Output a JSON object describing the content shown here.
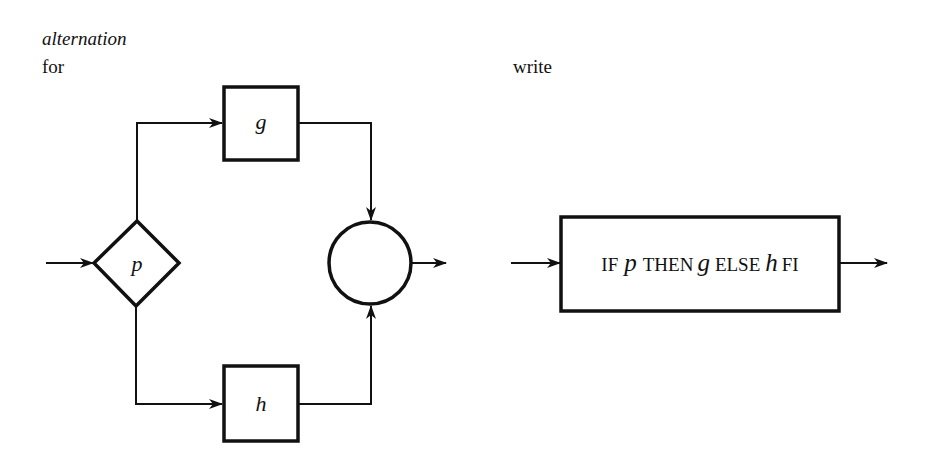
{
  "headings": {
    "construct_name": "alternation",
    "left_caption": "for",
    "right_caption": "write"
  },
  "flowchart": {
    "decision": {
      "label": "p",
      "shape": "diamond"
    },
    "then_branch": {
      "label": "g",
      "shape": "box"
    },
    "else_branch": {
      "label": "h",
      "shape": "box"
    },
    "join": {
      "label": "",
      "shape": "circle"
    }
  },
  "equivalent": {
    "shape": "box",
    "tokens": [
      {
        "text": "IF",
        "style": "roman"
      },
      {
        "text": "p",
        "style": "italic"
      },
      {
        "text": "THEN",
        "style": "roman"
      },
      {
        "text": "g",
        "style": "italic"
      },
      {
        "text": "ELSE",
        "style": "roman"
      },
      {
        "text": "h",
        "style": "italic"
      },
      {
        "text": "FI",
        "style": "roman"
      }
    ]
  },
  "colors": {
    "ink": "#111111",
    "background": "#ffffff"
  }
}
